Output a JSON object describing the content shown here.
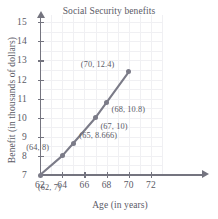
{
  "chart_data": {
    "type": "line",
    "title": "Social Security benefits",
    "xlabel": "Age (in years)",
    "ylabel": "Benefit (in thousands of dollars)",
    "xlim": [
      62,
      73
    ],
    "ylim": [
      7,
      15.4
    ],
    "xticks": [
      62,
      64,
      66,
      68,
      70,
      72
    ],
    "yticks": [
      7,
      8,
      9,
      10,
      11,
      12,
      13,
      14,
      15
    ],
    "grid": true,
    "legend": null,
    "x": [
      62,
      64,
      65,
      67,
      68,
      70
    ],
    "values": [
      7,
      8,
      8.666,
      10,
      10.8,
      12.4
    ],
    "points": [
      {
        "x": 62,
        "y": 7,
        "label": "(62, 7)"
      },
      {
        "x": 64,
        "y": 8,
        "label": "(64, 8)"
      },
      {
        "x": 65,
        "y": 8.666,
        "label": "(65, 8.666)"
      },
      {
        "x": 67,
        "y": 10,
        "label": "(67, 10)"
      },
      {
        "x": 68,
        "y": 10.8,
        "label": "(68, 10.8)"
      },
      {
        "x": 70,
        "y": 12.4,
        "label": "(70, 12.4)"
      }
    ],
    "annotations": [
      "(62, 7)",
      "(64, 8)",
      "(65, 8.666)",
      "(67, 10)",
      "(68, 10.8)",
      "(70, 12.4)"
    ],
    "series_color": "#7b7b88",
    "axis_color": "#74747f",
    "grid_color": "#f0f0f3",
    "text_color": "#5a5a66"
  },
  "axis": {
    "x_tick_labels": [
      "62",
      "64",
      "66",
      "68",
      "70",
      "72"
    ],
    "y_tick_labels": [
      "7",
      "8",
      "9",
      "10",
      "11",
      "12",
      "13",
      "14",
      "15"
    ]
  }
}
